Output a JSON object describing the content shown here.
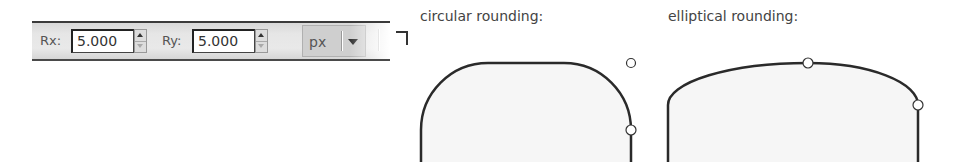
{
  "toolbar": {
    "rx": {
      "label": "Rx:",
      "value": "5.000"
    },
    "ry": {
      "label": "Ry:",
      "value": "5.000"
    },
    "unit": {
      "selected": "px"
    },
    "reset_corners_icon": "not-rounded-corner-icon"
  },
  "illustrations": {
    "circular": {
      "caption": "circular rounding:"
    },
    "elliptical": {
      "caption": "elliptical rounding:"
    }
  },
  "colors": {
    "stroke": "#2a2a2a",
    "fill": "#f6f6f6",
    "toolbar_bg": "#e6e6e6"
  }
}
